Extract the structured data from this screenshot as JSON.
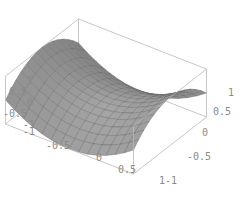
{
  "chart_data": {
    "type": "surface3d",
    "title": "",
    "function": "z = x^2 - y^2",
    "xlabel": "",
    "ylabel": "",
    "zlabel": "",
    "x_range": [
      -1,
      1
    ],
    "y_range": [
      -1,
      1
    ],
    "z_range": [
      -1,
      1
    ],
    "grid_divisions": 14,
    "x_ticks": [
      "-1",
      "-0.5",
      "0",
      "0.5",
      "1"
    ],
    "y_ticks": [
      "-1",
      "-0.5",
      "0",
      "0.5",
      "1"
    ],
    "z_ticks": [
      "-1",
      "-0.5",
      "0",
      "0.5",
      "1"
    ],
    "box": true,
    "surface_color": "#8e8e8e",
    "mesh_color": "#5f5f5f",
    "box_color": "#b9b9b9",
    "tick_color": "#8a8a8a"
  },
  "labels": {
    "z": [
      {
        "text": "1",
        "x": 27,
        "y": 84
      },
      {
        "text": "0.5",
        "x": 9,
        "y": 95
      },
      {
        "text": "0",
        "x": 27,
        "y": 106
      },
      {
        "text": "-0.5",
        "x": 3,
        "y": 117
      },
      {
        "text": "-1",
        "x": 23,
        "y": 128
      },
      {
        "text": "-1",
        "x": 23,
        "y": 135
      }
    ],
    "x": [
      {
        "text": "-0.5",
        "x": 46,
        "y": 149
      },
      {
        "text": "0",
        "x": 96,
        "y": 161
      },
      {
        "text": "0.5",
        "x": 118,
        "y": 173
      },
      {
        "text": "1",
        "x": 159,
        "y": 184
      }
    ],
    "y": [
      {
        "text": "-1",
        "x": 165,
        "y": 184
      },
      {
        "text": "-0.5",
        "x": 187,
        "y": 160
      },
      {
        "text": "0",
        "x": 202,
        "y": 136
      },
      {
        "text": "0.5",
        "x": 213,
        "y": 115
      },
      {
        "text": "1",
        "x": 228,
        "y": 96
      }
    ]
  }
}
